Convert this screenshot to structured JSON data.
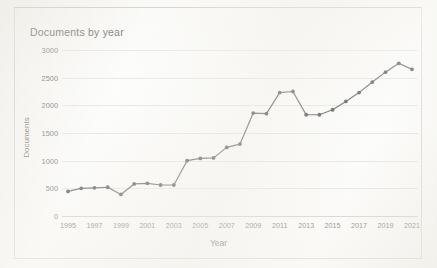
{
  "chart_data": {
    "type": "line",
    "title": "Documents by year",
    "xlabel": "Year",
    "ylabel": "Documents",
    "grid": true,
    "legend": false,
    "xlim": [
      1995,
      2021
    ],
    "ylim": [
      0,
      3000
    ],
    "ytick_labels": [
      "0",
      "500",
      "1000",
      "1500",
      "2000",
      "2500",
      "3000"
    ],
    "ytick_values": [
      0,
      500,
      1000,
      1500,
      2000,
      2500,
      3000
    ],
    "xtick_labels": [
      "1995",
      "1997",
      "1999",
      "2001",
      "2003",
      "2005",
      "2007",
      "2009",
      "2011",
      "2013",
      "2015",
      "2017",
      "2019",
      "2021"
    ],
    "xtick_values": [
      1995,
      1997,
      1999,
      2001,
      2003,
      2005,
      2007,
      2009,
      2011,
      2013,
      2015,
      2017,
      2019,
      2021
    ],
    "marker": "circle",
    "line_color": "#595959",
    "marker_color": "#4d4d4d",
    "x": [
      1995,
      1996,
      1997,
      1998,
      1999,
      2000,
      2001,
      2002,
      2003,
      2004,
      2005,
      2006,
      2007,
      2008,
      2009,
      2010,
      2011,
      2012,
      2013,
      2014,
      2015,
      2016,
      2017,
      2018,
      2019,
      2020,
      2021
    ],
    "values": [
      445,
      500,
      510,
      520,
      390,
      580,
      590,
      560,
      560,
      1000,
      1040,
      1050,
      1240,
      1300,
      1860,
      1850,
      2230,
      2250,
      1830,
      1830,
      1920,
      2070,
      2230,
      2420,
      2600,
      2760,
      2650
    ],
    "series": [
      {
        "name": "Documents",
        "values": [
          445,
          500,
          510,
          520,
          390,
          580,
          590,
          560,
          560,
          1000,
          1040,
          1050,
          1240,
          1300,
          1860,
          1850,
          2230,
          2250,
          1830,
          1830,
          1920,
          2070,
          2230,
          2420,
          2600,
          2760,
          2650
        ]
      }
    ]
  },
  "colors": {
    "line": "#595959",
    "grid": "#e6e5e2",
    "text": "#5f5f5f",
    "title": "#3b3b3b",
    "frame": "#d9d7d2"
  }
}
